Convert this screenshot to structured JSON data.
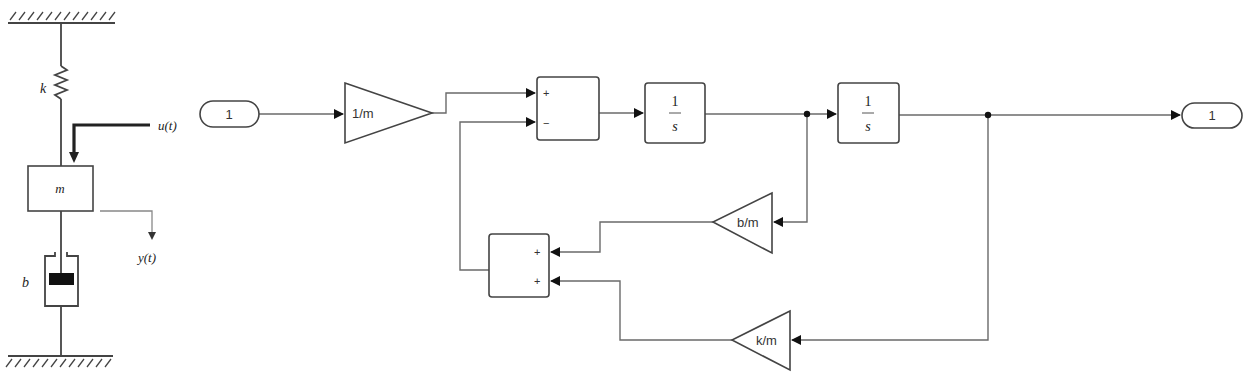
{
  "physical_model": {
    "spring_label": "k",
    "mass_label": "m",
    "damper_label": "b",
    "input_label": "u(t)",
    "output_label": "y(t)"
  },
  "simulink": {
    "inport": {
      "label": "1"
    },
    "gain_input": {
      "label": "1/m"
    },
    "sum_main": {
      "signs": [
        "+",
        "−"
      ]
    },
    "integrator_1": {
      "numerator": "1",
      "denominator": "s"
    },
    "integrator_2": {
      "numerator": "1",
      "denominator": "s"
    },
    "gain_damping": {
      "label": "b/m"
    },
    "gain_spring": {
      "label": "k/m"
    },
    "sum_feedback": {
      "signs": [
        "+",
        "+"
      ]
    },
    "outport": {
      "label": "1"
    }
  },
  "colors": {
    "background": "#ffffff",
    "wire": "#6a6a6a",
    "block_border": "#444444",
    "damper_piston": "#111111"
  }
}
